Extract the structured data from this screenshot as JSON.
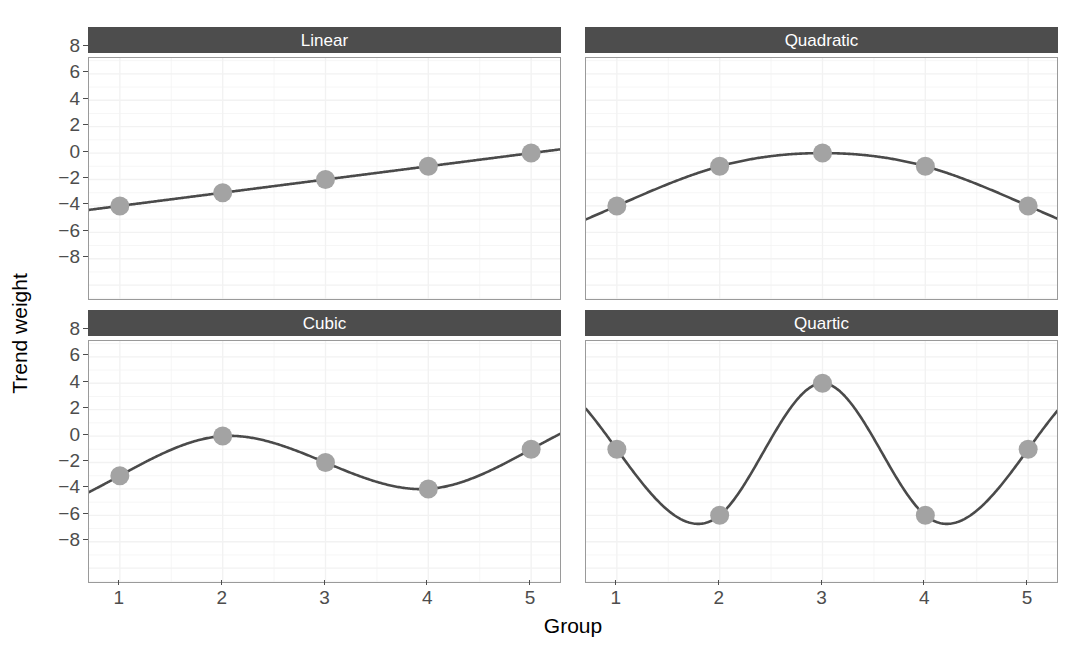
{
  "chart_data": {
    "type": "line",
    "title": "",
    "xlabel": "Group",
    "ylabel": "Trend weight",
    "x": [
      1,
      2,
      3,
      4,
      5
    ],
    "xlim": [
      0.7,
      5.3
    ],
    "ylim": [
      -9.2,
      9.2
    ],
    "xticks": [
      "1",
      "2",
      "3",
      "4",
      "5"
    ],
    "yticks": [
      "8",
      "6",
      "4",
      "2",
      "0",
      "−2",
      "−4",
      "−6",
      "−8"
    ],
    "ytick_values": [
      8,
      6,
      4,
      2,
      0,
      -2,
      -4,
      -6,
      -8
    ],
    "grid": true,
    "legend": "none",
    "facet_layout": "2x2",
    "colors": {
      "strip_background": "#4d4d4d",
      "strip_text": "#ffffff",
      "line": "#4a4a4a",
      "point": "#a3a3a3",
      "panel_background": "#ffffff",
      "panel_border": "#9a9a9a",
      "gridline": "#f2f2f2",
      "axis_text": "#4d4d4d",
      "axis_title": "#000000"
    },
    "panels": [
      {
        "label": "Linear",
        "position": "top-left",
        "categories": [
          "1",
          "2",
          "3",
          "4",
          "5"
        ],
        "values": [
          -2,
          -1,
          0,
          1,
          2
        ]
      },
      {
        "label": "Quadratic",
        "position": "top-right",
        "categories": [
          "1",
          "2",
          "3",
          "4",
          "5"
        ],
        "values": [
          -2,
          1,
          2,
          1,
          -2
        ]
      },
      {
        "label": "Cubic",
        "position": "bottom-left",
        "categories": [
          "1",
          "2",
          "3",
          "4",
          "5"
        ],
        "values": [
          -1,
          2,
          0,
          -2,
          1
        ]
      },
      {
        "label": "Quartic",
        "position": "bottom-right",
        "categories": [
          "1",
          "2",
          "3",
          "4",
          "5"
        ],
        "values": [
          1,
          -4,
          6,
          -4,
          1
        ]
      }
    ]
  }
}
